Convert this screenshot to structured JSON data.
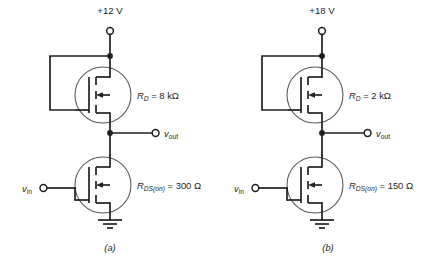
{
  "figure": {
    "title": "",
    "background_color": "#ffffff",
    "line_color": "#231f20",
    "device_outline_color": "#58595b"
  },
  "circuits": [
    {
      "id": "circuit-a",
      "caption": "(a)",
      "supply_label": "+12 V",
      "input_label_main": "v",
      "input_label_sub": "in",
      "output_label_main": "v",
      "output_label_sub": "out",
      "load_resistance": {
        "symbol_main": "R",
        "symbol_sub": "D",
        "equals": "=",
        "value": "8 k",
        "unit": "Ω",
        "full_text": "R_D = 8 kΩ"
      },
      "on_resistance": {
        "symbol_main": "R",
        "symbol_sub": "DS(on)",
        "equals": "=",
        "value": "300",
        "unit": "Ω",
        "full_text": "R_DS(on) = 300 Ω"
      },
      "upper_device": "n-channel-mosfet-active-load",
      "lower_device": "n-channel-mosfet-switch",
      "ground": "ground-symbol"
    },
    {
      "id": "circuit-b",
      "caption": "(b)",
      "supply_label": "+18 V",
      "input_label_main": "v",
      "input_label_sub": "in",
      "output_label_main": "v",
      "output_label_sub": "out",
      "load_resistance": {
        "symbol_main": "R",
        "symbol_sub": "D",
        "equals": "=",
        "value": "2 k",
        "unit": "Ω",
        "full_text": "R_D = 2 kΩ"
      },
      "on_resistance": {
        "symbol_main": "R",
        "symbol_sub": "DS(on)",
        "equals": "=",
        "value": "150",
        "unit": "Ω",
        "full_text": "R_DS(on) = 150 Ω"
      },
      "upper_device": "n-channel-mosfet-active-load",
      "lower_device": "n-channel-mosfet-switch",
      "ground": "ground-symbol"
    }
  ]
}
